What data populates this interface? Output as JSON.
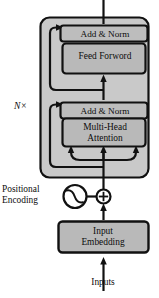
{
  "diagram": {
    "colors": {
      "outer_block_fill": "#c9c9c9",
      "inner_box_fill": "#b9b9b9",
      "stroke": "#111111",
      "background": "#ffffff",
      "text": "#0d0d0d"
    },
    "blocks": [
      {
        "id": "add_norm_top",
        "label": "Add & Norm",
        "fill": "#bdbdbd"
      },
      {
        "id": "feed_forward",
        "label": "Feed Forword",
        "fill": "#b9b9b9"
      },
      {
        "id": "add_norm_bottom",
        "label": "Add & Norm",
        "fill": "#bdbdbd"
      },
      {
        "id": "multi_head",
        "label": "Multi-Head\nAttention",
        "fill": "#b9b9b9"
      },
      {
        "id": "input_embedding",
        "label": "Input\nEmbedding",
        "fill": "#b9b9b9"
      }
    ],
    "annotations": {
      "repeat_count": "N×",
      "positional_encoding": "Positional\nEncoding",
      "inputs": "Inputs"
    },
    "symbols": {
      "sine_circle": "sine-wave-circle-icon",
      "add_operator": "circled-plus-icon"
    },
    "connections": [
      {
        "from": "inputs",
        "to": "input_embedding",
        "type": "arrow-up"
      },
      {
        "from": "input_embedding",
        "to": "add_operator",
        "type": "arrow-up"
      },
      {
        "from": "sine_circle",
        "to": "add_operator",
        "type": "line-right"
      },
      {
        "from": "add_operator",
        "to": "multi_head",
        "type": "arrow-up-fanout-3"
      },
      {
        "from": "multi_head",
        "to": "add_norm_bottom",
        "type": "arrow-up"
      },
      {
        "from": "residual_bottom",
        "to": "add_norm_bottom",
        "type": "skip-arrow-left"
      },
      {
        "from": "add_norm_bottom",
        "to": "feed_forward",
        "type": "arrow-up"
      },
      {
        "from": "feed_forward",
        "to": "add_norm_top",
        "type": "arrow-up"
      },
      {
        "from": "residual_top",
        "to": "add_norm_top",
        "type": "skip-arrow-left"
      },
      {
        "from": "add_norm_top",
        "to": "output",
        "type": "line-up"
      }
    ]
  }
}
